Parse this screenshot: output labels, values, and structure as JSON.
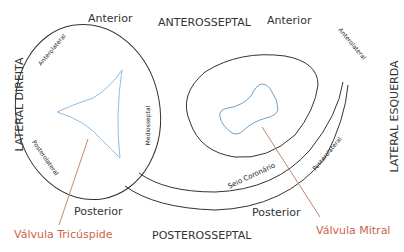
{
  "labels": {
    "anterior_left": "Anterior",
    "anterosseptal": "ANTEROSSEPTAL",
    "anterior_right": "Anterior",
    "lateral_direita": "LATERAL DIREITA",
    "lateral_esquerda": "LATERAL ESQUERDA",
    "anterolateral_left": "Anterolateral",
    "anterolateral_right": "Anterolateral",
    "mediosseptal": "Mediosseptal",
    "posterolateral_left": "Posterolateral",
    "posterolateral_right": "Posterolateral",
    "seio_coronario": "Seio Coronário",
    "posterior_left": "Posterior",
    "posterior_right": "Posterior",
    "posterosseptal": "POSTEROSSEPTAL",
    "valvula_tricuspide": "Válvula Tricúspide",
    "valvula_mitral": "Válvula Mitral"
  },
  "colors": {
    "outline": "#333333",
    "valve_shape": "#7fb0dc",
    "pointer": "#c8654a"
  }
}
